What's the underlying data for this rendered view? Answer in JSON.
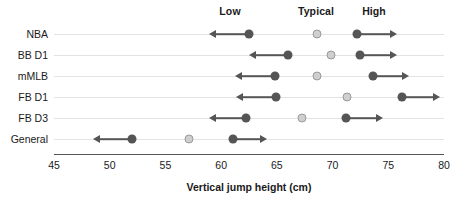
{
  "chart_data": {
    "type": "scatter",
    "title": "",
    "xlabel": "Vertical jump height (cm)",
    "ylabel": "",
    "xlim": [
      45,
      80
    ],
    "xticks": [
      45,
      50,
      55,
      60,
      65,
      70,
      75,
      80
    ],
    "xtick_labels": [
      "45",
      "50",
      "55",
      "60",
      "65",
      "70",
      "75",
      "80"
    ],
    "grid": true,
    "legend": "none",
    "column_headers": [
      {
        "label": "Low",
        "x": 62.5
      },
      {
        "label": "Typical",
        "x": 68.4
      },
      {
        "label": "High",
        "x": 73.6
      }
    ],
    "categories": [
      "NBA",
      "BB D1",
      "mMLB",
      "FB D1",
      "FB D3",
      "General"
    ],
    "series": [
      {
        "name": "Low",
        "marker": "dark-dot",
        "values": [
          62.5,
          66.0,
          64.8,
          64.9,
          62.2,
          52.0
        ]
      },
      {
        "name": "Typical",
        "marker": "light-dot",
        "values": [
          68.6,
          69.9,
          68.6,
          71.3,
          67.3,
          57.1
        ]
      },
      {
        "name": "High",
        "marker": "dark-dot",
        "values": [
          72.2,
          72.5,
          73.6,
          76.2,
          71.2,
          61.1
        ]
      }
    ],
    "low_arrow_ends": [
      58.9,
      62.5,
      61.2,
      61.3,
      58.9,
      48.5
    ],
    "high_arrow_ends": [
      75.8,
      75.8,
      76.9,
      79.6,
      74.5,
      64.1
    ],
    "colors": {
      "dark_marker": "#555555",
      "light_marker_fill": "#cfcfcf",
      "light_marker_edge": "#9a9a9a",
      "gridline": "#e3e3e3",
      "axis": "#555555",
      "text": "#1a1a1a",
      "background": "#ffffff"
    }
  }
}
